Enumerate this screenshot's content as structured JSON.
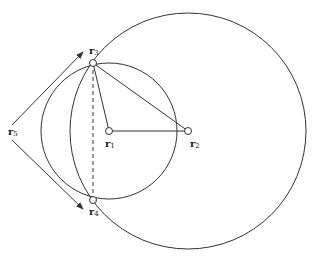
{
  "diagram": {
    "stroke_color": "#333333",
    "background": "#ffffff",
    "circles": [
      {
        "id": "small-circle",
        "cx": 109,
        "cy": 131,
        "r": 68
      },
      {
        "id": "large-circle",
        "cx": 188,
        "cy": 131,
        "r": 118
      }
    ],
    "points": [
      {
        "id": "r1",
        "x": 109,
        "y": 131
      },
      {
        "id": "r2",
        "x": 188,
        "y": 131
      },
      {
        "id": "r3",
        "x": 93,
        "y": 63
      },
      {
        "id": "r4",
        "x": 93,
        "y": 200
      }
    ],
    "labels": {
      "r1": {
        "base": "r",
        "sub": "1"
      },
      "r2": {
        "base": "r",
        "sub": "2"
      },
      "r3": {
        "base": "r",
        "sub": "3"
      },
      "r4": {
        "base": "r",
        "sub": "4"
      },
      "r5": {
        "base": "r",
        "sub": "5"
      }
    }
  }
}
